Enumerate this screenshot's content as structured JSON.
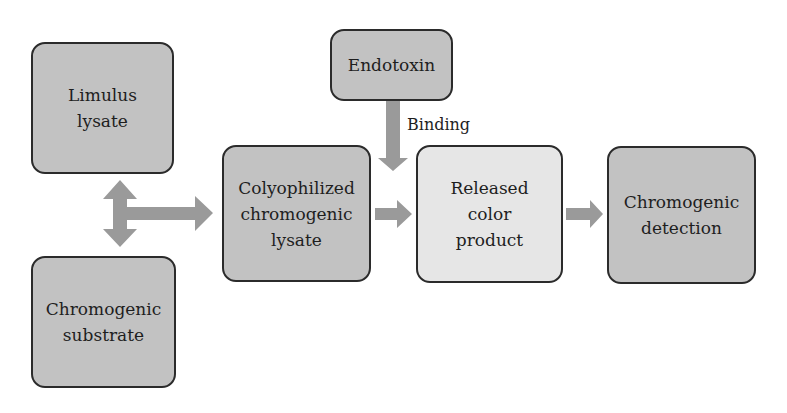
{
  "diagram": {
    "nodes": {
      "limulus_lysate": "Limulus\nlysate",
      "chromogenic_substrate": "Chromogenic\nsubstrate",
      "colyophilized_lysate": "Colyophilized\nchromogenic\nlysate",
      "endotoxin": "Endotoxin",
      "released_color_product": "Released\ncolor\nproduct",
      "chromogenic_detection": "Chromogenic\ndetection"
    },
    "edge_labels": {
      "binding": "Binding"
    },
    "colors": {
      "dark_box": "#c2c2c2",
      "light_box": "#e6e6e6",
      "arrow": "#9a9a9a",
      "border": "#2b2b2b"
    }
  }
}
